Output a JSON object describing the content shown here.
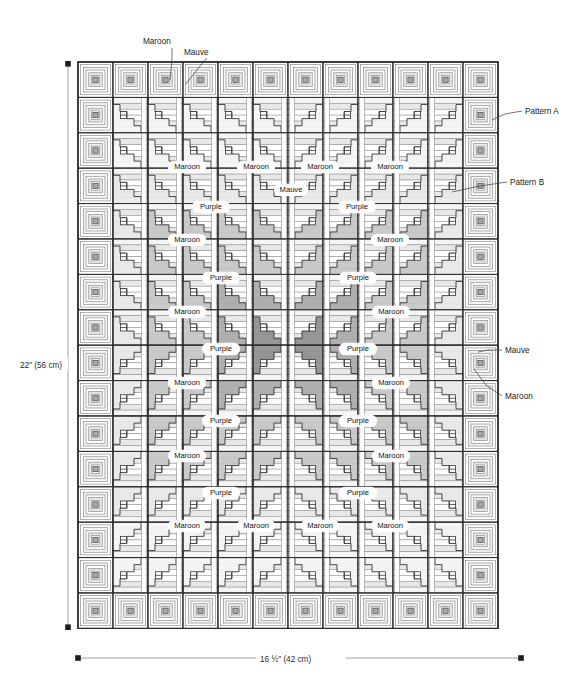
{
  "diagram": {
    "type": "quilt-pattern-schematic"
  },
  "dimensions": {
    "height_label": "22\" (56 cm)",
    "width_label": "16 ½\" (42 cm)"
  },
  "grid": {
    "columns": 12,
    "rows": 16,
    "left": 78,
    "top": 62,
    "cell_width": 35.0,
    "cell_height": 35.4
  },
  "colors": {
    "background": "#ffffff",
    "outline": "#2b2b2b",
    "thin_line": "#7d7d7d",
    "white_fabric": "#ffffff",
    "cream_fabric": "#f4f4f4",
    "light_grey_fabric": "#e8e8e8",
    "mauve_fabric": "#c6c6c6",
    "maroon_fabric": "#a9a9a9",
    "purple_fabric": "#8e8e8e",
    "dark_accent": "#6f6f6f",
    "leader_line": "#3a3a3a",
    "dimension_line": "#8a8a8a"
  },
  "callouts": [
    {
      "id": "maroon-top",
      "label": "Maroon",
      "text_x": 143,
      "text_y": 44,
      "anchor": "start",
      "path": "M172,48 L172,60 L170,80"
    },
    {
      "id": "mauve-top",
      "label": "Mauve",
      "text_x": 184,
      "text_y": 55,
      "anchor": "start",
      "path": "M207,58 L200,66 L186,84"
    },
    {
      "id": "pattern-a",
      "label": "Pattern A",
      "text_x": 525,
      "text_y": 114,
      "anchor": "start",
      "path": "M522,111 L505,114 L492,120"
    },
    {
      "id": "pattern-b",
      "label": "Pattern B",
      "text_x": 510,
      "text_y": 185,
      "anchor": "start",
      "path": "M507,182 L480,186 L452,192"
    },
    {
      "id": "mauve-right",
      "label": "Mauve",
      "text_x": 505,
      "text_y": 353,
      "anchor": "start",
      "path": "M502,350 L488,350 L478,352"
    },
    {
      "id": "maroon-right",
      "label": "Maroon",
      "text_x": 505,
      "text_y": 399,
      "anchor": "start",
      "path": "M502,396 L486,385 L474,369"
    }
  ],
  "inner_labels": [
    {
      "label": "Maroon",
      "x": 187,
      "y": 167
    },
    {
      "label": "Maroon",
      "x": 256,
      "y": 167
    },
    {
      "label": "Maroon",
      "x": 320,
      "y": 167
    },
    {
      "label": "Maroon",
      "x": 390,
      "y": 167
    },
    {
      "label": "Mauve",
      "x": 291,
      "y": 190
    },
    {
      "label": "Purple",
      "x": 211,
      "y": 207
    },
    {
      "label": "Purple",
      "x": 357,
      "y": 207
    },
    {
      "label": "Maroon",
      "x": 187,
      "y": 240
    },
    {
      "label": "Maroon",
      "x": 390,
      "y": 240
    },
    {
      "label": "Purple",
      "x": 221,
      "y": 278
    },
    {
      "label": "Purple",
      "x": 358,
      "y": 278
    },
    {
      "label": "Maroon",
      "x": 187,
      "y": 312
    },
    {
      "label": "Maroon",
      "x": 391,
      "y": 312
    },
    {
      "label": "Purple",
      "x": 221,
      "y": 349
    },
    {
      "label": "Purple",
      "x": 358,
      "y": 349
    },
    {
      "label": "Maroon",
      "x": 187,
      "y": 383
    },
    {
      "label": "Maroon",
      "x": 391,
      "y": 383
    },
    {
      "label": "Purple",
      "x": 221,
      "y": 421
    },
    {
      "label": "Purple",
      "x": 358,
      "y": 421
    },
    {
      "label": "Maroon",
      "x": 187,
      "y": 456
    },
    {
      "label": "Maroon",
      "x": 391,
      "y": 456
    },
    {
      "label": "Purple",
      "x": 221,
      "y": 493
    },
    {
      "label": "Purple",
      "x": 358,
      "y": 493
    },
    {
      "label": "Maroon",
      "x": 187,
      "y": 526
    },
    {
      "label": "Maroon",
      "x": 256,
      "y": 526
    },
    {
      "label": "Maroon",
      "x": 320,
      "y": 526
    },
    {
      "label": "Maroon",
      "x": 390,
      "y": 526
    }
  ]
}
